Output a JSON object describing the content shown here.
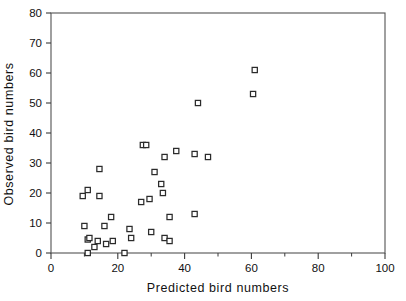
{
  "chart_data": {
    "type": "scatter",
    "title": "",
    "xlabel": "Predicted bird numbers",
    "ylabel": "Observed bird numbers",
    "xlim": [
      0,
      100
    ],
    "ylim": [
      0,
      80
    ],
    "xticks": [
      0,
      20,
      40,
      60,
      80,
      100
    ],
    "xticks_minor": [
      10,
      30,
      50,
      70,
      90
    ],
    "yticks": [
      0,
      10,
      20,
      30,
      40,
      50,
      60,
      70,
      80
    ],
    "xtick_labels": [
      "0",
      "20",
      "40",
      "60",
      "80",
      "100"
    ],
    "ytick_labels": [
      "0",
      "10",
      "20",
      "30",
      "40",
      "50",
      "60",
      "70",
      "80"
    ],
    "grid": false,
    "legend": null,
    "marker": "open-square",
    "marker_color": "#2b2b2b",
    "marker_fill": "#ffffff",
    "frame_color": "#5a5a5a",
    "points": [
      {
        "x": 9.5,
        "y": 19.0
      },
      {
        "x": 11.0,
        "y": 21.0
      },
      {
        "x": 14.5,
        "y": 19.0
      },
      {
        "x": 14.5,
        "y": 28.0
      },
      {
        "x": 10.0,
        "y": 9.0
      },
      {
        "x": 11.0,
        "y": 4.5
      },
      {
        "x": 11.5,
        "y": 5.0
      },
      {
        "x": 11.0,
        "y": 0.0
      },
      {
        "x": 13.0,
        "y": 2.0
      },
      {
        "x": 14.0,
        "y": 4.0
      },
      {
        "x": 16.0,
        "y": 9.0
      },
      {
        "x": 16.5,
        "y": 3.0
      },
      {
        "x": 18.0,
        "y": 12.0
      },
      {
        "x": 18.5,
        "y": 4.0
      },
      {
        "x": 22.0,
        "y": 0.0
      },
      {
        "x": 23.5,
        "y": 8.0
      },
      {
        "x": 24.0,
        "y": 5.0
      },
      {
        "x": 27.0,
        "y": 17.0
      },
      {
        "x": 27.5,
        "y": 36.0
      },
      {
        "x": 28.5,
        "y": 36.0
      },
      {
        "x": 29.5,
        "y": 18.0
      },
      {
        "x": 30.0,
        "y": 7.0
      },
      {
        "x": 31.0,
        "y": 27.0
      },
      {
        "x": 33.0,
        "y": 23.0
      },
      {
        "x": 33.5,
        "y": 20.0
      },
      {
        "x": 34.0,
        "y": 32.0
      },
      {
        "x": 34.0,
        "y": 5.0
      },
      {
        "x": 35.5,
        "y": 12.0
      },
      {
        "x": 35.5,
        "y": 4.0
      },
      {
        "x": 37.5,
        "y": 34.0
      },
      {
        "x": 43.0,
        "y": 33.0
      },
      {
        "x": 43.0,
        "y": 13.0
      },
      {
        "x": 44.0,
        "y": 50.0
      },
      {
        "x": 47.0,
        "y": 32.0
      },
      {
        "x": 60.5,
        "y": 53.0
      },
      {
        "x": 61.0,
        "y": 61.0
      }
    ]
  }
}
